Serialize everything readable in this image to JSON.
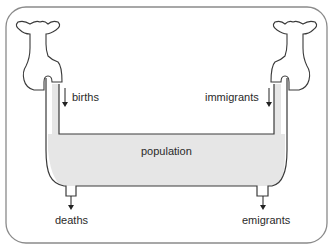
{
  "diagram": {
    "title": "",
    "labels": {
      "births": "births",
      "immigrants": "immigrants",
      "population": "population",
      "deaths": "deaths",
      "emigrants": "emigrants"
    },
    "colors": {
      "outline": "#3a3a3a",
      "frame": "#8a8a8a",
      "water": "#e6e6e6",
      "background": "#ffffff"
    }
  }
}
